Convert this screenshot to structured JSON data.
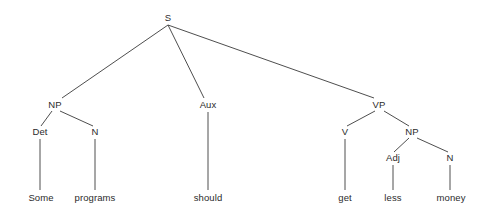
{
  "diagram": {
    "type": "syntax-tree",
    "sentence": "Some programs should get less money",
    "line_color": "#3a3a3a",
    "text_color": "#2b2b2b",
    "background_color": "#ffffff",
    "nodes": [
      {
        "id": "S",
        "label": "S",
        "x": 168,
        "y": 18,
        "kind": "nonterminal"
      },
      {
        "id": "NP1",
        "label": "NP",
        "x": 55,
        "y": 105,
        "kind": "nonterminal"
      },
      {
        "id": "AUX",
        "label": "Aux",
        "x": 208,
        "y": 105,
        "kind": "nonterminal"
      },
      {
        "id": "VP",
        "label": "VP",
        "x": 379,
        "y": 105,
        "kind": "nonterminal"
      },
      {
        "id": "DET",
        "label": "Det",
        "x": 40,
        "y": 132,
        "kind": "nonterminal"
      },
      {
        "id": "N1",
        "label": "N",
        "x": 95,
        "y": 132,
        "kind": "nonterminal"
      },
      {
        "id": "V",
        "label": "V",
        "x": 345,
        "y": 132,
        "kind": "nonterminal"
      },
      {
        "id": "NP2",
        "label": "NP",
        "x": 412,
        "y": 132,
        "kind": "nonterminal"
      },
      {
        "id": "ADJ",
        "label": "Adj",
        "x": 393,
        "y": 158,
        "kind": "nonterminal"
      },
      {
        "id": "N2",
        "label": "N",
        "x": 450,
        "y": 158,
        "kind": "nonterminal"
      },
      {
        "id": "W1",
        "label": "Some",
        "x": 41,
        "y": 198,
        "kind": "terminal"
      },
      {
        "id": "W2",
        "label": "programs",
        "x": 95,
        "y": 198,
        "kind": "terminal"
      },
      {
        "id": "W3",
        "label": "should",
        "x": 208,
        "y": 198,
        "kind": "terminal"
      },
      {
        "id": "W4",
        "label": "get",
        "x": 345,
        "y": 198,
        "kind": "terminal"
      },
      {
        "id": "W5",
        "label": "less",
        "x": 393,
        "y": 198,
        "kind": "terminal"
      },
      {
        "id": "W6",
        "label": "money",
        "x": 451,
        "y": 198,
        "kind": "terminal"
      }
    ],
    "edges": [
      {
        "from": "S",
        "to": "NP1",
        "x1": 168,
        "y1": 25,
        "x2": 62,
        "y2": 98
      },
      {
        "from": "S",
        "to": "AUX",
        "x1": 168,
        "y1": 25,
        "x2": 204,
        "y2": 98
      },
      {
        "from": "S",
        "to": "VP",
        "x1": 168,
        "y1": 25,
        "x2": 374,
        "y2": 98
      },
      {
        "from": "NP1",
        "to": "DET",
        "x1": 52,
        "y1": 111,
        "x2": 41,
        "y2": 126
      },
      {
        "from": "NP1",
        "to": "N1",
        "x1": 60,
        "y1": 111,
        "x2": 93,
        "y2": 126
      },
      {
        "from": "AUX",
        "to": "W3",
        "x1": 208,
        "y1": 112,
        "x2": 208,
        "y2": 190
      },
      {
        "from": "VP",
        "to": "V",
        "x1": 375,
        "y1": 111,
        "x2": 347,
        "y2": 126
      },
      {
        "from": "VP",
        "to": "NP2",
        "x1": 384,
        "y1": 111,
        "x2": 409,
        "y2": 126
      },
      {
        "from": "DET",
        "to": "W1",
        "x1": 40,
        "y1": 139,
        "x2": 40,
        "y2": 190
      },
      {
        "from": "N1",
        "to": "W2",
        "x1": 95,
        "y1": 139,
        "x2": 95,
        "y2": 190
      },
      {
        "from": "V",
        "to": "W4",
        "x1": 345,
        "y1": 139,
        "x2": 345,
        "y2": 190
      },
      {
        "from": "NP2",
        "to": "ADJ",
        "x1": 409,
        "y1": 138,
        "x2": 394,
        "y2": 152
      },
      {
        "from": "NP2",
        "to": "N2",
        "x1": 417,
        "y1": 138,
        "x2": 448,
        "y2": 152
      },
      {
        "from": "ADJ",
        "to": "W5",
        "x1": 393,
        "y1": 165,
        "x2": 393,
        "y2": 190
      },
      {
        "from": "N2",
        "to": "W6",
        "x1": 450,
        "y1": 165,
        "x2": 450,
        "y2": 190
      }
    ]
  }
}
